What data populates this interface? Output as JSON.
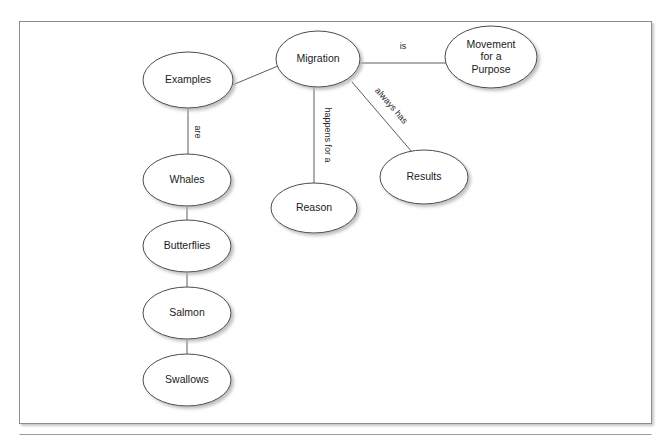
{
  "page": {
    "background_color": "#ffffff",
    "frame": {
      "x": 19.5,
      "y": 21.5,
      "width": 632,
      "height": 402,
      "border_color": "#8d8d8d",
      "fill_color": "#ffffff"
    },
    "separator_rule": {
      "x1": 19.5,
      "y1": 434.5,
      "x2": 651.5,
      "y2": 434.5,
      "color": "#9a9a9a"
    }
  },
  "diagram": {
    "type": "concept-map",
    "node_style": {
      "fill": "#ffffff",
      "stroke": "#4a4a4a",
      "text_color": "#1b1b1b",
      "shadow_color": "#bdbdbd"
    },
    "edge_style": {
      "stroke": "#5c5c5c",
      "label_color": "#262626"
    },
    "nodes": [
      {
        "id": "migration",
        "label": "Migration",
        "lines": [
          "Migration"
        ],
        "cx": 318,
        "cy": 59,
        "rx": 42,
        "ry": 28
      },
      {
        "id": "movement",
        "label": "Movement for a Purpose",
        "lines": [
          "Movement",
          "for a",
          "Purpose"
        ],
        "cx": 491,
        "cy": 57,
        "rx": 46,
        "ry": 31
      },
      {
        "id": "examples",
        "label": "Examples",
        "lines": [
          "Examples"
        ],
        "cx": 188,
        "cy": 80,
        "rx": 45,
        "ry": 28
      },
      {
        "id": "reason",
        "label": "Reason",
        "lines": [
          "Reason"
        ],
        "cx": 314,
        "cy": 208,
        "rx": 43,
        "ry": 25
      },
      {
        "id": "results",
        "label": "Results",
        "lines": [
          "Results"
        ],
        "cx": 424,
        "cy": 177,
        "rx": 44,
        "ry": 27
      },
      {
        "id": "whales",
        "label": "Whales",
        "lines": [
          "Whales"
        ],
        "cx": 187,
        "cy": 180,
        "rx": 44,
        "ry": 26
      },
      {
        "id": "butterflies",
        "label": "Butterflies",
        "lines": [
          "Butterflies"
        ],
        "cx": 187,
        "cy": 246,
        "rx": 44,
        "ry": 26
      },
      {
        "id": "salmon",
        "label": "Salmon",
        "lines": [
          "Salmon"
        ],
        "cx": 187,
        "cy": 313,
        "rx": 44,
        "ry": 26
      },
      {
        "id": "swallows",
        "label": "Swallows",
        "lines": [
          "Swallows"
        ],
        "cx": 187,
        "cy": 380,
        "rx": 44,
        "ry": 26
      }
    ],
    "edges": [
      {
        "id": "migration-movement",
        "from": "migration",
        "to": "movement",
        "label": "is",
        "x1": 360,
        "y1": 63,
        "x2": 446,
        "y2": 63,
        "label_x": 403,
        "label_y": 47,
        "label_rotation": 0
      },
      {
        "id": "migration-examples",
        "from": "migration",
        "to": "examples",
        "label": "",
        "x1": 278,
        "y1": 66,
        "x2": 230,
        "y2": 86,
        "label_x": 254,
        "label_y": 70,
        "label_rotation": 0
      },
      {
        "id": "migration-reason",
        "from": "migration",
        "to": "reason",
        "label": "happens for a",
        "x1": 314,
        "y1": 87,
        "x2": 314,
        "y2": 184,
        "label_x": 327,
        "label_y": 135,
        "label_rotation": 90
      },
      {
        "id": "migration-results",
        "from": "migration",
        "to": "results",
        "label": "always has",
        "x1": 352,
        "y1": 82,
        "x2": 412,
        "y2": 152,
        "label_x": 391,
        "label_y": 106,
        "label_rotation": 49
      },
      {
        "id": "examples-whales",
        "from": "examples",
        "to": "whales",
        "label": "are",
        "x1": 188,
        "y1": 108,
        "x2": 188,
        "y2": 155,
        "label_x": 197,
        "label_y": 132,
        "label_rotation": 90
      },
      {
        "id": "whales-butterflies",
        "from": "whales",
        "to": "butterflies",
        "label": "",
        "x1": 187,
        "y1": 206,
        "x2": 187,
        "y2": 220,
        "label_x": 187,
        "label_y": 213,
        "label_rotation": 0
      },
      {
        "id": "butterflies-salmon",
        "from": "butterflies",
        "to": "salmon",
        "label": "",
        "x1": 187,
        "y1": 272,
        "x2": 187,
        "y2": 287,
        "label_x": 187,
        "label_y": 280,
        "label_rotation": 0
      },
      {
        "id": "salmon-swallows",
        "from": "salmon",
        "to": "swallows",
        "label": "",
        "x1": 187,
        "y1": 339,
        "x2": 187,
        "y2": 354,
        "label_x": 187,
        "label_y": 346,
        "label_rotation": 0
      }
    ]
  }
}
